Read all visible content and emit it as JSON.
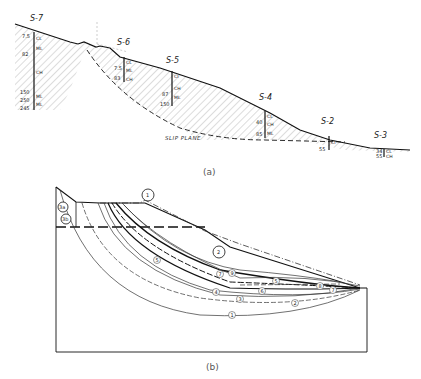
{
  "figure_a": {
    "caption": "(a)",
    "boring_labels": [
      "S-7",
      "S-6",
      "S-5",
      "S-4",
      "S-2",
      "S-3"
    ],
    "slip_plane_label": "SLIP PLANE",
    "soil_codes": {
      "s7": [
        "CL",
        "ML",
        "CH",
        "ML",
        "ML"
      ],
      "s6": [
        "CL",
        "ML",
        "CH"
      ],
      "s5": [
        "CI",
        "CH",
        "ML"
      ],
      "s4": [
        "CL",
        "CH",
        "ML"
      ],
      "s2": [
        "CI"
      ],
      "s3": [
        "CL",
        "CH"
      ]
    },
    "depths": {
      "s7": [
        "7.5",
        "7.5",
        "82",
        "150",
        "250",
        "245"
      ],
      "s6": [
        "7.5",
        "83"
      ],
      "s5": [
        "87",
        "150"
      ],
      "s4": [
        "40",
        "85"
      ],
      "s2": [
        "55"
      ],
      "s3": [
        "34",
        "55"
      ]
    }
  },
  "figure_b": {
    "caption": "(b)",
    "corner_labels": [
      "3a",
      "3b"
    ],
    "curve_labels": [
      "1",
      "2",
      "3",
      "4",
      "5",
      "6",
      "7",
      "8",
      "9"
    ],
    "top_labels": [
      "1",
      "2"
    ]
  }
}
